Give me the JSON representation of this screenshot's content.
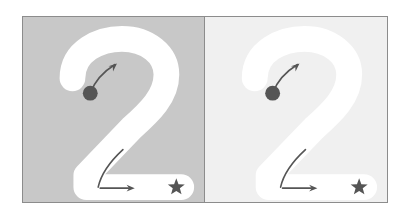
{
  "figure": {
    "type": "stroke-order-diagram",
    "character": "2",
    "panel_count": 2,
    "canvas": {
      "width": 410,
      "height": 218,
      "background": "#ffffff"
    },
    "frame": {
      "x": 22,
      "y": 16,
      "width": 366,
      "height": 187,
      "border_color": "#8c8c8c",
      "border_width": 1
    }
  },
  "colors": {
    "page_background": "#ffffff",
    "panel_border": "#8c8c8c",
    "panel_left_background": "#c8c8c8",
    "panel_right_background": "#f0f0f0",
    "glyph_stroke": "#ffffff",
    "marker_dark": "#555555",
    "arrow_color": "#555555",
    "star_color": "#555555",
    "dot_color": "#555555"
  },
  "panels": [
    {
      "id": "panel-left",
      "name": "high-contrast-panel",
      "background": "#c8c8c8",
      "contrast_label": "dark",
      "glyph": {
        "character": "2",
        "stroke_color": "#ffffff",
        "stroke_width": 26
      },
      "markers": {
        "start_dot": {
          "cx": 68,
          "cy": 77,
          "r": 7.5,
          "color": "#555555"
        },
        "start_arrow": {
          "from_x": 68,
          "from_y": 77,
          "to_x": 95,
          "to_y": 47,
          "color": "#555555"
        },
        "baseline_arrow": {
          "from_x": 78,
          "from_y": 173,
          "to_x": 113,
          "to_y": 173,
          "color": "#555555"
        },
        "baseline_curve": {
          "from_x": 72,
          "from_y": 172,
          "to_x": 101,
          "to_y": 134,
          "color": "#555555"
        },
        "end_star": {
          "cx": 155,
          "cy": 172,
          "r": 9,
          "points": 5,
          "color": "#555555"
        }
      }
    },
    {
      "id": "panel-right",
      "name": "low-contrast-panel",
      "background": "#f0f0f0",
      "contrast_label": "light",
      "glyph": {
        "character": "2",
        "stroke_color": "#ffffff",
        "stroke_width": 26
      },
      "markers": {
        "start_dot": {
          "cx": 68,
          "cy": 77,
          "r": 7.5,
          "color": "#555555"
        },
        "start_arrow": {
          "from_x": 68,
          "from_y": 77,
          "to_x": 95,
          "to_y": 47,
          "color": "#555555"
        },
        "baseline_arrow": {
          "from_x": 78,
          "from_y": 173,
          "to_x": 113,
          "to_y": 173,
          "color": "#555555"
        },
        "baseline_curve": {
          "from_x": 72,
          "from_y": 172,
          "to_x": 101,
          "to_y": 134,
          "color": "#555555"
        },
        "end_star": {
          "cx": 155,
          "cy": 172,
          "r": 9,
          "points": 5,
          "color": "#555555"
        }
      }
    }
  ],
  "glyph_path": "M 50 62 C 50 34, 78 22, 100 22 C 126 22, 145 38, 145 58 C 145 80, 128 96, 110 112 L 64 160 L 64 172 L 160 172",
  "start_arrow_path": "M 68 77 C 72 66, 80 56, 93 48",
  "baseline_curve_path": "M 101 134 C 88 146, 79 158, 76 172"
}
